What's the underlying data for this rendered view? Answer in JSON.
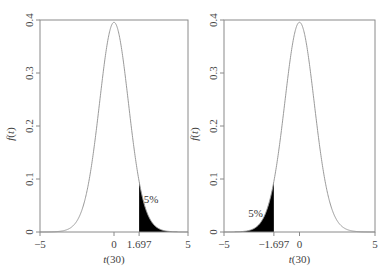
{
  "chart_data": [
    {
      "type": "area",
      "title": "",
      "distribution": "t(30)",
      "xlabel": "t(30)",
      "ylabel": "f(t)",
      "xlim": [
        -5,
        5
      ],
      "ylim": [
        0,
        0.4
      ],
      "x_ticks": [
        "-5",
        "0",
        "1.697",
        "5"
      ],
      "y_ticks": [
        "0",
        "0.1",
        "0.2",
        "0.3",
        "0.4"
      ],
      "grid": false,
      "shaded_region": {
        "from": 1.697,
        "to": 5,
        "tail": "right",
        "color": "#000000"
      },
      "annotation": "5%",
      "critical_value": 1.697,
      "peak": {
        "x": 0,
        "y": 0.395
      }
    },
    {
      "type": "area",
      "title": "",
      "distribution": "t(30)",
      "xlabel": "t(30)",
      "ylabel": "f(t)",
      "xlim": [
        -5,
        5
      ],
      "ylim": [
        0,
        0.4
      ],
      "x_ticks": [
        "-5",
        "-1.697",
        "0",
        "5"
      ],
      "y_ticks": [
        "0",
        "0.1",
        "0.2",
        "0.3",
        "0.4"
      ],
      "grid": false,
      "shaded_region": {
        "from": -5,
        "to": -1.697,
        "tail": "left",
        "color": "#000000"
      },
      "annotation": "5%",
      "critical_value": -1.697,
      "peak": {
        "x": 0,
        "y": 0.395
      }
    }
  ],
  "colors": {
    "curve": "#9a9a9a",
    "frame": "#8a8a8a",
    "shade": "#000000"
  }
}
